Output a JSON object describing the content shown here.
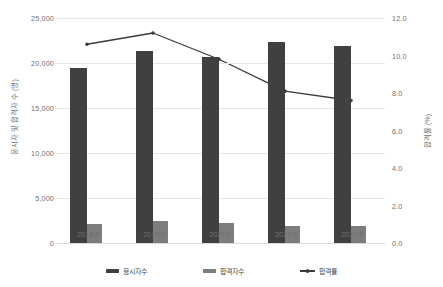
{
  "chart_data": {
    "type": "bar",
    "title": "",
    "subtitle": "",
    "xlabel": "",
    "ylabel": "응시자 및 합격자 수 (명)",
    "y2label": "합격률 (%)",
    "categories": [
      "2018년",
      "2019년",
      "2020년",
      "2021년",
      "2022년"
    ],
    "ylim": [
      0,
      25000
    ],
    "y2lim": [
      0,
      12.0
    ],
    "yticks": [
      "0",
      "5,000",
      "10,000",
      "15,000",
      "20,000",
      "25,000"
    ],
    "ytick_values": [
      0,
      5000,
      10000,
      15000,
      20000,
      25000
    ],
    "y2ticks": [
      "0.0",
      "2.0",
      "4.0",
      "6.0",
      "8.0",
      "10.0",
      "12.0"
    ],
    "y2tick_values": [
      0,
      2,
      4,
      6,
      8,
      10,
      12
    ],
    "grid": true,
    "legend_position": "bottom",
    "series": [
      {
        "name": "응시자수",
        "type": "bar",
        "axis": "left",
        "color": "#404040",
        "values": [
          19400,
          21300,
          20700,
          22300,
          21900
        ]
      },
      {
        "name": "합격자수",
        "type": "bar",
        "axis": "left",
        "color": "#7d7d7d",
        "values": [
          2100,
          2400,
          2200,
          1900,
          1850
        ]
      },
      {
        "name": "합격률",
        "type": "line",
        "axis": "right",
        "color": "#3a3a3a",
        "values": [
          10.6,
          11.2,
          9.8,
          8.1,
          7.6
        ]
      }
    ]
  },
  "legend": {
    "items": [
      {
        "label": "응시자수",
        "kind": "bar",
        "color": "#404040"
      },
      {
        "label": "합격자수",
        "kind": "bar",
        "color": "#7d7d7d"
      },
      {
        "label": "합격률",
        "kind": "line",
        "color": "#3a3a3a"
      }
    ]
  },
  "colors": {
    "primary_bar": "#404040",
    "secondary_bar": "#7d7d7d",
    "line": "#3a3a3a",
    "gridline": "#e6e6e6",
    "axis_text": "#6f6f6f",
    "background": "#ffffff"
  }
}
